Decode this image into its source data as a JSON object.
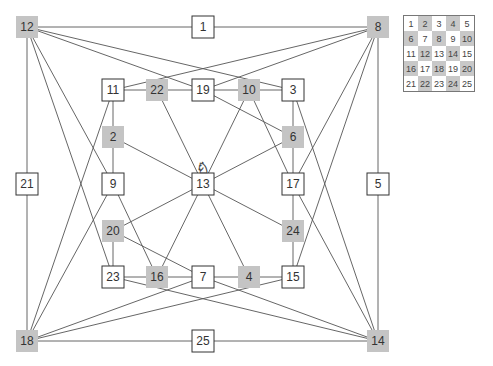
{
  "colors": {
    "dark": "#c4c4c4",
    "light": "#ffffff",
    "edge": "#555555",
    "border": "#333333"
  },
  "nodes": [
    {
      "id": 12,
      "x": 27,
      "y": 27,
      "dark": true
    },
    {
      "id": 1,
      "x": 203,
      "y": 27,
      "dark": false
    },
    {
      "id": 8,
      "x": 378,
      "y": 27,
      "dark": true
    },
    {
      "id": 11,
      "x": 113,
      "y": 90,
      "dark": false
    },
    {
      "id": 22,
      "x": 157,
      "y": 90,
      "dark": true
    },
    {
      "id": 19,
      "x": 203,
      "y": 90,
      "dark": false
    },
    {
      "id": 10,
      "x": 249,
      "y": 90,
      "dark": true
    },
    {
      "id": 3,
      "x": 293,
      "y": 90,
      "dark": false
    },
    {
      "id": 2,
      "x": 113,
      "y": 137,
      "dark": true
    },
    {
      "id": 6,
      "x": 293,
      "y": 137,
      "dark": true
    },
    {
      "id": 21,
      "x": 27,
      "y": 184,
      "dark": false
    },
    {
      "id": 9,
      "x": 113,
      "y": 184,
      "dark": false
    },
    {
      "id": 13,
      "x": 203,
      "y": 184,
      "dark": false
    },
    {
      "id": 17,
      "x": 293,
      "y": 184,
      "dark": false
    },
    {
      "id": 5,
      "x": 378,
      "y": 184,
      "dark": false
    },
    {
      "id": 20,
      "x": 113,
      "y": 231,
      "dark": true
    },
    {
      "id": 24,
      "x": 293,
      "y": 231,
      "dark": true
    },
    {
      "id": 23,
      "x": 113,
      "y": 277,
      "dark": false
    },
    {
      "id": 16,
      "x": 157,
      "y": 277,
      "dark": true
    },
    {
      "id": 7,
      "x": 203,
      "y": 277,
      "dark": false
    },
    {
      "id": 4,
      "x": 249,
      "y": 277,
      "dark": true
    },
    {
      "id": 15,
      "x": 293,
      "y": 277,
      "dark": false
    },
    {
      "id": 18,
      "x": 27,
      "y": 341,
      "dark": true
    },
    {
      "id": 25,
      "x": 203,
      "y": 341,
      "dark": false
    },
    {
      "id": 14,
      "x": 378,
      "y": 341,
      "dark": true
    }
  ],
  "edges": [
    [
      1,
      8
    ],
    [
      1,
      12
    ],
    [
      2,
      9
    ],
    [
      2,
      11
    ],
    [
      2,
      13
    ],
    [
      3,
      6
    ],
    [
      3,
      10
    ],
    [
      3,
      12
    ],
    [
      3,
      14
    ],
    [
      4,
      7
    ],
    [
      4,
      13
    ],
    [
      4,
      15
    ],
    [
      5,
      8
    ],
    [
      5,
      14
    ],
    [
      6,
      13
    ],
    [
      6,
      17
    ],
    [
      6,
      19
    ],
    [
      7,
      14
    ],
    [
      7,
      16
    ],
    [
      7,
      18
    ],
    [
      7,
      20
    ],
    [
      8,
      11
    ],
    [
      8,
      15
    ],
    [
      8,
      17
    ],
    [
      8,
      19
    ],
    [
      9,
      12
    ],
    [
      9,
      16
    ],
    [
      9,
      18
    ],
    [
      10,
      13
    ],
    [
      10,
      17
    ],
    [
      10,
      19
    ],
    [
      11,
      18
    ],
    [
      11,
      22
    ],
    [
      12,
      19
    ],
    [
      12,
      21
    ],
    [
      12,
      23
    ],
    [
      13,
      16
    ],
    [
      13,
      20
    ],
    [
      13,
      22
    ],
    [
      13,
      24
    ],
    [
      14,
      17
    ],
    [
      14,
      23
    ],
    [
      14,
      25
    ],
    [
      15,
      18
    ],
    [
      15,
      24
    ],
    [
      16,
      23
    ],
    [
      17,
      24
    ],
    [
      18,
      21
    ],
    [
      18,
      25
    ],
    [
      19,
      22
    ],
    [
      20,
      23
    ]
  ],
  "knight_at": 13,
  "knight_icon": "knight-icon",
  "board": {
    "cells": [
      1,
      2,
      3,
      4,
      5,
      6,
      7,
      8,
      9,
      10,
      11,
      12,
      13,
      14,
      15,
      16,
      17,
      18,
      19,
      20,
      21,
      22,
      23,
      24,
      25
    ],
    "dark_cells": [
      2,
      4,
      6,
      8,
      10,
      12,
      14,
      16,
      18,
      20,
      22,
      24
    ]
  }
}
